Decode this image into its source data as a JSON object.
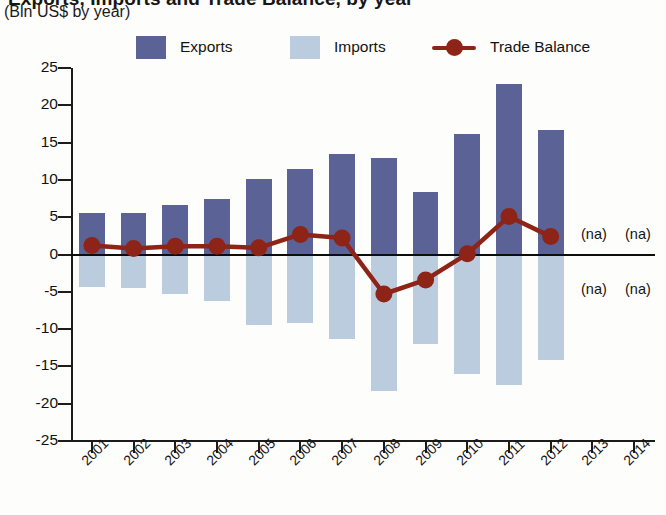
{
  "header": {
    "title_clipped": "Exports, Imports and Trade Balance, by year",
    "subtitle": "(Bln US$ by year)"
  },
  "legend": {
    "items": [
      {
        "label": "Exports",
        "type": "swatch",
        "color": "#5b6396"
      },
      {
        "label": "Imports",
        "type": "swatch",
        "color": "#bcccdf"
      },
      {
        "label": "Trade Balance",
        "type": "line-marker",
        "color": "#8e2318"
      }
    ]
  },
  "annotations": {
    "na_top_2013": "(na)",
    "na_top_2014": "(na)",
    "na_bottom_2013": "(na)",
    "na_bottom_2014": "(na)"
  },
  "colors": {
    "exports": "#5b6396",
    "imports": "#bcccdf",
    "trade_balance": "#8e2318",
    "axis": "#1b1b1b",
    "background": "#fdfdfb"
  },
  "chart_data": {
    "type": "bar",
    "title": "Exports, Imports and Trade Balance, by year",
    "subtitle": "(Bln US$ by year)",
    "xlabel": "",
    "ylabel": "Bln US$",
    "ylim": [
      -25,
      25
    ],
    "yticks": [
      25,
      20,
      15,
      10,
      5,
      0,
      -5,
      -10,
      -15,
      -20,
      -25
    ],
    "ytick_labels": [
      "25",
      "20",
      "15",
      "10",
      "5",
      "0",
      "-5",
      "-10",
      "-15",
      "-20",
      "-25"
    ],
    "grid": false,
    "legend_position": "top",
    "categories": [
      "2001",
      "2002",
      "2003",
      "2004",
      "2005",
      "2006",
      "2007",
      "2008",
      "2009",
      "2010",
      "2011",
      "2012",
      "2013",
      "2014"
    ],
    "series": [
      {
        "name": "Exports",
        "type": "bar",
        "color": "#5b6396",
        "values": [
          5.5,
          5.5,
          6.6,
          7.5,
          10.1,
          11.5,
          13.5,
          13.0,
          8.4,
          16.1,
          22.8,
          16.7,
          null,
          null
        ]
      },
      {
        "name": "Imports",
        "type": "bar",
        "color": "#bcccdf",
        "values": [
          -4.3,
          -4.5,
          -5.3,
          -6.3,
          -9.4,
          -9.2,
          -11.3,
          -18.3,
          -12.0,
          -16.0,
          -17.5,
          -14.1,
          null,
          null
        ]
      },
      {
        "name": "Trade Balance",
        "type": "line",
        "color": "#8e2318",
        "values": [
          1.2,
          0.8,
          1.1,
          1.1,
          0.9,
          2.7,
          2.2,
          -5.3,
          -3.4,
          0.1,
          5.1,
          2.4,
          null,
          null
        ]
      }
    ],
    "missing_marker": "(na)",
    "missing_years": [
      "2013",
      "2014"
    ]
  }
}
